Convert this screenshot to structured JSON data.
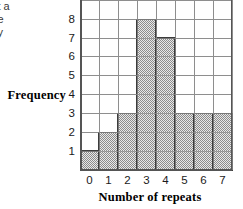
{
  "margin_text": {
    "lines": [
      "ct a",
      "ve",
      "cy"
    ]
  },
  "chart_data": {
    "type": "bar",
    "title": "",
    "xlabel": "Number of repeats",
    "ylabel": "Frequency",
    "categories": [
      "0",
      "1",
      "2",
      "3",
      "4",
      "5",
      "6",
      "7"
    ],
    "values": [
      1,
      2,
      3,
      8,
      7,
      3,
      3,
      3
    ],
    "ytick_labels": [
      "1",
      "2",
      "3",
      "4",
      "5",
      "6",
      "7",
      "8"
    ],
    "ytick_values": [
      1,
      2,
      3,
      4,
      5,
      6,
      7,
      8
    ],
    "xlim": [
      0,
      8
    ],
    "ylim": [
      0,
      9
    ],
    "grid": true,
    "legend": "none",
    "bar_fill": "#a8a8a8",
    "bar_edge": "#3c3c3c",
    "grid_color": "#8e8e8e",
    "axis_color": "#555555"
  }
}
